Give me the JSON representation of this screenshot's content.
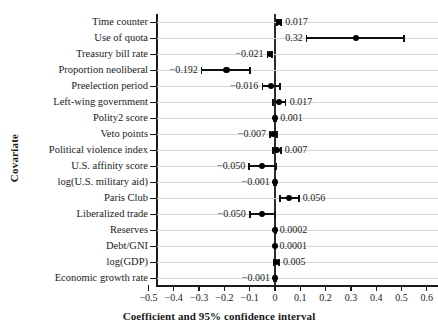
{
  "chart_data": {
    "type": "scatter",
    "title": "",
    "xlabel": "Coefficient and 95% confidence interval",
    "ylabel": "Covariate",
    "xlim": [
      -0.55,
      0.62
    ],
    "xticks": [
      -0.5,
      -0.4,
      -0.3,
      -0.2,
      -0.1,
      0,
      0.1,
      0.2,
      0.3,
      0.4,
      0.5,
      0.6
    ],
    "xticklabels": [
      "−0.5",
      "−0.4",
      "−0.3",
      "−0.2",
      "−0.1",
      "0",
      "0.1",
      "0.2",
      "0.3",
      "0.4",
      "0.5",
      "0.6"
    ],
    "grid": "horizontal",
    "legend": "none",
    "reference_line": 0,
    "categories": [
      "Time counter",
      "Use of quota",
      "Treasury bill rate",
      "Proportion neoliberal",
      "Preelection period",
      "Left-wing government",
      "Polity2 score",
      "Veto points",
      "Political violence index",
      "U.S. affinity score",
      "log(U.S. military aid)",
      "Paris Club",
      "Liberalized trade",
      "Reserves",
      "Debt/GNI",
      "log(GDP)",
      "Economic growth rate"
    ],
    "points": [
      {
        "label": "Time counter",
        "value": 0.017,
        "value_text": "0.017",
        "ci_low": 0.009,
        "ci_high": 0.025,
        "label_side": "right"
      },
      {
        "label": "Use of quota",
        "value": 0.32,
        "value_text": "0.32",
        "ci_low": 0.125,
        "ci_high": 0.51,
        "label_side": "left"
      },
      {
        "label": "Treasury bill rate",
        "value": -0.021,
        "value_text": "−0.021",
        "ci_low": -0.03,
        "ci_high": -0.012,
        "label_side": "left"
      },
      {
        "label": "Proportion neoliberal",
        "value": -0.192,
        "value_text": "−0.192",
        "ci_low": -0.29,
        "ci_high": -0.098,
        "label_side": "left"
      },
      {
        "label": "Preelection period",
        "value": -0.016,
        "value_text": "−0.016",
        "ci_low": -0.05,
        "ci_high": 0.02,
        "label_side": "left"
      },
      {
        "label": "Left-wing government",
        "value": 0.017,
        "value_text": "0.017",
        "ci_low": -0.008,
        "ci_high": 0.042,
        "label_side": "right"
      },
      {
        "label": "Polity2 score",
        "value": 0.001,
        "value_text": "0.001",
        "ci_low": -0.003,
        "ci_high": 0.005,
        "label_side": "right"
      },
      {
        "label": "Veto points",
        "value": -0.007,
        "value_text": "−0.007",
        "ci_low": -0.02,
        "ci_high": 0.007,
        "label_side": "left"
      },
      {
        "label": "Political violence index",
        "value": 0.007,
        "value_text": "0.007",
        "ci_low": -0.008,
        "ci_high": 0.023,
        "label_side": "right"
      },
      {
        "label": "U.S. affinity score",
        "value": -0.05,
        "value_text": "−0.050",
        "ci_low": -0.102,
        "ci_high": 0.005,
        "label_side": "left"
      },
      {
        "label": "log(U.S. military aid)",
        "value": -0.001,
        "value_text": "−0.001",
        "ci_low": -0.005,
        "ci_high": 0.003,
        "label_side": "left"
      },
      {
        "label": "Paris Club",
        "value": 0.056,
        "value_text": "0.056",
        "ci_low": 0.02,
        "ci_high": 0.094,
        "label_side": "right"
      },
      {
        "label": "Liberalized trade",
        "value": -0.05,
        "value_text": "−0.050",
        "ci_low": -0.1,
        "ci_high": 0.0,
        "label_side": "left"
      },
      {
        "label": "Reserves",
        "value": 0.0002,
        "value_text": "0.0002",
        "ci_low": -0.002,
        "ci_high": 0.003,
        "label_side": "right"
      },
      {
        "label": "Debt/GNI",
        "value": 0.0001,
        "value_text": "0.0001",
        "ci_low": -0.002,
        "ci_high": 0.002,
        "label_side": "right"
      },
      {
        "label": "log(GDP)",
        "value": 0.005,
        "value_text": "0.005",
        "ci_low": -0.006,
        "ci_high": 0.016,
        "label_side": "right"
      },
      {
        "label": "Economic growth rate",
        "value": -0.001,
        "value_text": "−0.001",
        "ci_low": -0.004,
        "ci_high": 0.003,
        "label_side": "left"
      }
    ]
  },
  "colors": {
    "point": "#000000",
    "ci": "#111111",
    "grid": "#d6d6d6",
    "axis": "#1a1a1a",
    "background": "#ffffff"
  }
}
